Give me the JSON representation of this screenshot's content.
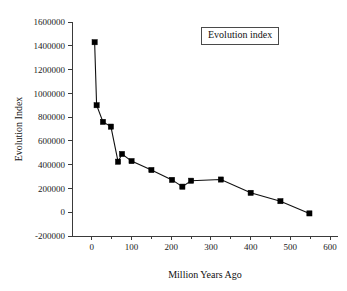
{
  "chart_data": {
    "type": "line",
    "title": "",
    "legend": [
      "Evolution index"
    ],
    "legend_position": "top-right-inside",
    "xlabel": "Million Years Ago",
    "ylabel": "Evolution Index",
    "xlim": [
      -50,
      620
    ],
    "ylim": [
      -200000,
      1600000
    ],
    "xticks": [
      0,
      100,
      200,
      300,
      400,
      500,
      600
    ],
    "xtick_labels": [
      "0",
      "100",
      "200",
      "300",
      "400",
      "500",
      "600"
    ],
    "yticks": [
      -200000,
      0,
      200000,
      400000,
      600000,
      800000,
      1000000,
      1200000,
      1400000,
      1600000
    ],
    "ytick_labels": [
      "-200000",
      "0",
      "200000",
      "400000",
      "600000",
      "800000",
      "1000000",
      "1200000",
      "1400000",
      "1600000"
    ],
    "grid": false,
    "marker": "square",
    "marker_color": "#000000",
    "line_color": "#101010",
    "series": [
      {
        "name": "Evolution index",
        "x": [
          7,
          12,
          28,
          48,
          66,
          76,
          100,
          150,
          202,
          228,
          250,
          325,
          400,
          475,
          548
        ],
        "y": [
          1430000,
          900000,
          760000,
          720000,
          425000,
          490000,
          430000,
          355000,
          272000,
          215000,
          265000,
          275000,
          163000,
          93000,
          -10000
        ]
      }
    ]
  },
  "labels": {
    "legend_text": "Evolution index",
    "x_axis_title": "Million Years Ago",
    "y_axis_title": "Evolution Index"
  }
}
